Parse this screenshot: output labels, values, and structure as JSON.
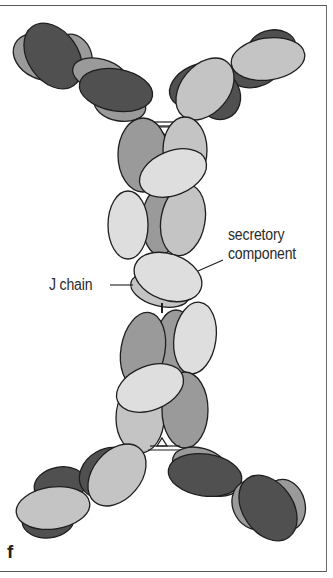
{
  "figure": {
    "panel_letter": "f",
    "labels": {
      "secretory_line1": "secretory",
      "secretory_line2": "component",
      "j_chain": "J chain"
    },
    "colors": {
      "heavy_dark": "#505050",
      "medium_gray": "#9a9a9a",
      "light_gray": "#c4c4c4",
      "very_light": "#dedede",
      "outline": "#1e1e1e",
      "frame": "#5a5a5a"
    }
  }
}
